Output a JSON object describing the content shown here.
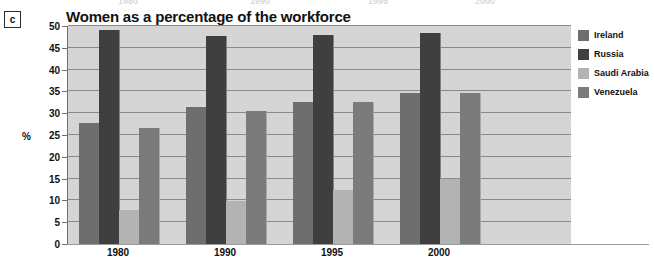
{
  "panel": {
    "letter": "c"
  },
  "ghost_row": {
    "note": "faint bleed-through year labels from the chart above",
    "items": [
      {
        "text": "1980",
        "x": 118
      },
      {
        "text": "1990",
        "x": 250
      },
      {
        "text": "1995",
        "x": 368
      },
      {
        "text": "2000",
        "x": 475
      }
    ]
  },
  "chart_data": {
    "type": "bar",
    "title": "Women as a percentage of the workforce",
    "xlabel": "",
    "ylabel": "%",
    "ylim": [
      0,
      50
    ],
    "ytick_step": 5,
    "yticks": [
      0,
      5,
      10,
      15,
      20,
      25,
      30,
      35,
      40,
      45,
      50
    ],
    "grid": true,
    "legend_position": "right",
    "categories": [
      "1980",
      "1990",
      "1995",
      "2000"
    ],
    "series": [
      {
        "name": "Ireland",
        "color": "#6e6e6e",
        "values": [
          27.8,
          31.5,
          32.6,
          34.6
        ]
      },
      {
        "name": "Russia",
        "color": "#3f3f3f",
        "values": [
          49.2,
          47.8,
          47.9,
          48.5
        ]
      },
      {
        "name": "Saudi Arabia",
        "color": "#b3b3b3",
        "values": [
          7.8,
          9.9,
          12.4,
          15.0
        ]
      },
      {
        "name": "Venezuela",
        "color": "#7b7b7b",
        "values": [
          26.5,
          30.5,
          32.5,
          34.6
        ]
      }
    ]
  },
  "colors": {
    "plot_background": "#d5d5d5",
    "gridline": "#8a8a8a",
    "text": "#111111"
  }
}
